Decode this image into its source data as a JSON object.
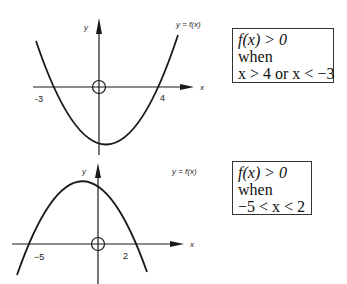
{
  "graphs": [
    {
      "function_label": "y = f(x)",
      "x_axis_label": "x",
      "y_axis_label": "y",
      "roots": [
        "-3",
        "4"
      ],
      "shape": "upward parabola",
      "note": {
        "line1": "f(x) > 0",
        "line2": "when",
        "line3": "x > 4 or x < −3"
      }
    },
    {
      "function_label": "y = f(x)",
      "x_axis_label": "x",
      "y_axis_label": "y",
      "roots": [
        "−5",
        "2"
      ],
      "shape": "downward parabola",
      "note": {
        "line1": "f(x) > 0",
        "line2": "when",
        "line3": "−5 < x < 2"
      }
    }
  ],
  "colors": {
    "ink": "#1a1a1a",
    "background": "#ffffff"
  }
}
